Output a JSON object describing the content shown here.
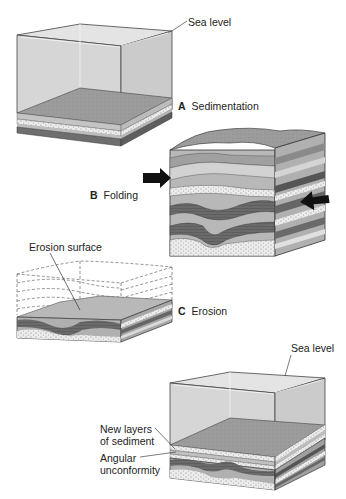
{
  "stages": [
    {
      "letter": "A",
      "name": "Sedimentation"
    },
    {
      "letter": "B",
      "name": "Folding"
    },
    {
      "letter": "C",
      "name": "Erosion"
    }
  ],
  "labels": {
    "sea_level_top": "Sea level",
    "sea_level_bottom": "Sea level",
    "erosion_surface": "Erosion surface",
    "new_layers_line1": "New layers",
    "new_layers_line2": "of sediment",
    "angular_line1": "Angular",
    "angular_line2": "unconformity"
  },
  "colors": {
    "water_front": "#d9d9d9",
    "water_side": "#cfcfcf",
    "water_top": "#e6e6e6",
    "sediment_top": "#9a9a9a",
    "layer_light": "#c8c8c8",
    "layer_dotted": "#e8e8e8",
    "layer_dark": "#6e6e6e",
    "layer_mid": "#a8a8a8",
    "outline": "#333333",
    "arrow": "#111111"
  }
}
